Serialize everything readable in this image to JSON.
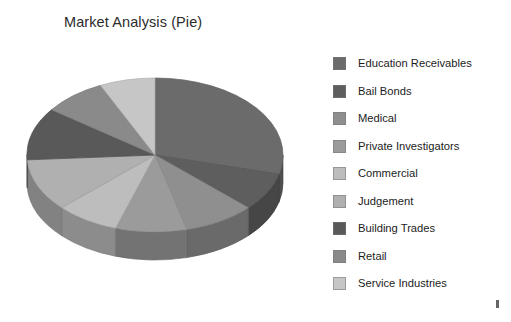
{
  "chart_data": {
    "type": "pie",
    "title": "Market Analysis (Pie)",
    "three_d": true,
    "legend_position": "right",
    "grid": false,
    "xlabel": "",
    "ylabel": "",
    "categories": [
      "Education Receivables",
      "Bail Bonds",
      "Medical",
      "Private Investigators",
      "Commercial",
      "Judgement",
      "Building Trades",
      "Retail",
      "Service Industries"
    ],
    "values": [
      29,
      8,
      9,
      9,
      8,
      11,
      11,
      8,
      7
    ],
    "colors": [
      "#6b6b6b",
      "#5e5e5e",
      "#8f8f8f",
      "#9b9b9b",
      "#bdbdbd",
      "#b0b0b0",
      "#595959",
      "#8a8a8a",
      "#c6c6c6"
    ],
    "start_angle_deg": 0
  },
  "legend": {
    "items": [
      {
        "label": "Education Receivables",
        "color": "#6b6b6b"
      },
      {
        "label": "Bail Bonds",
        "color": "#5e5e5e"
      },
      {
        "label": "Medical",
        "color": "#8f8f8f"
      },
      {
        "label": "Private Investigators",
        "color": "#9b9b9b"
      },
      {
        "label": "Commercial",
        "color": "#bdbdbd"
      },
      {
        "label": "Judgement",
        "color": "#b0b0b0"
      },
      {
        "label": "Building Trades",
        "color": "#595959"
      },
      {
        "label": "Retail",
        "color": "#8a8a8a"
      },
      {
        "label": "Service Industries",
        "color": "#c6c6c6"
      }
    ]
  },
  "canvas": {
    "background": "#ffffff"
  }
}
